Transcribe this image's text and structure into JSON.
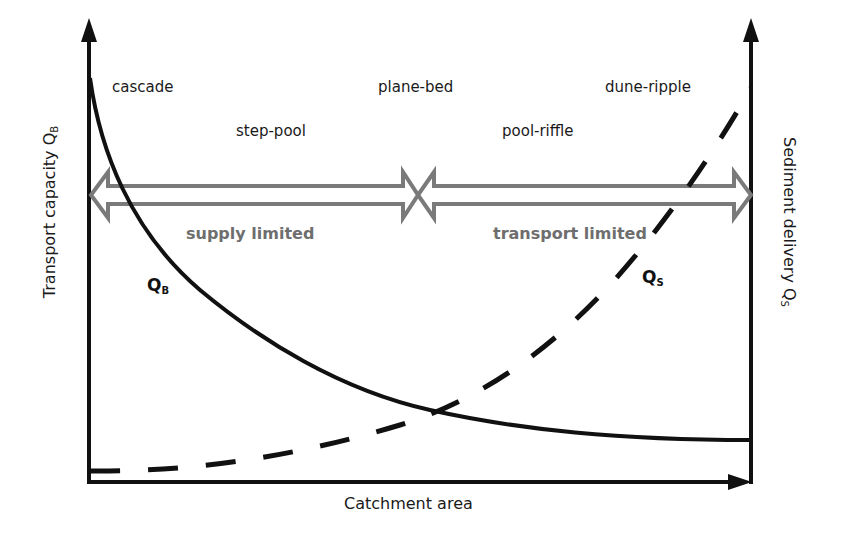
{
  "diagram": {
    "axes": {
      "x_label": "Catchment area",
      "y_left_label": "Transport capacity Q",
      "y_left_sub": "B",
      "y_right_label": "Sediment delivery Q",
      "y_right_sub": "S"
    },
    "regimes": [
      {
        "label": "cascade"
      },
      {
        "label": "step-pool"
      },
      {
        "label": "plane-bed"
      },
      {
        "label": "pool-riffle"
      },
      {
        "label": "dune-ripple"
      }
    ],
    "zones": [
      {
        "label": "supply limited"
      },
      {
        "label": "transport limited"
      }
    ],
    "curves": [
      {
        "name": "Q",
        "sub": "B",
        "style": "solid",
        "description": "Transport capacity decreasing with catchment area"
      },
      {
        "name": "Q",
        "sub": "S",
        "style": "dashed",
        "description": "Sediment delivery increasing with catchment area"
      }
    ],
    "colors": {
      "axis": "#111111",
      "curve": "#111111",
      "double_arrow": "#7a7a7a",
      "zone_text": "#6e6e6e"
    }
  }
}
